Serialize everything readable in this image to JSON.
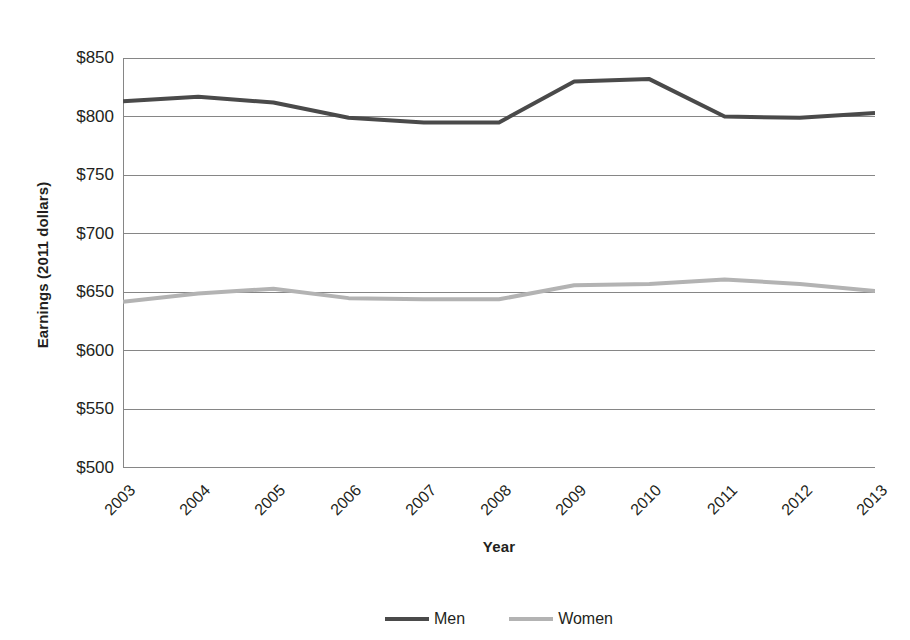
{
  "chart_data": {
    "type": "line",
    "title": "",
    "xlabel": "Year",
    "ylabel": "Earnings (2011 dollars)",
    "categories": [
      "2003",
      "2004",
      "2005",
      "2006",
      "2007",
      "2008",
      "2009",
      "2010",
      "2011",
      "2012",
      "2013"
    ],
    "x": [
      2003,
      2004,
      2005,
      2006,
      2007,
      2008,
      2009,
      2010,
      2011,
      2012,
      2013
    ],
    "ylim": [
      500,
      850
    ],
    "yticks": [
      850,
      800,
      750,
      700,
      650,
      600,
      550,
      500
    ],
    "ytick_labels": [
      "$850",
      "$800",
      "$750",
      "$700",
      "$650",
      "$600",
      "$550",
      "$500"
    ],
    "grid": "horizontal",
    "legend_position": "bottom",
    "series": [
      {
        "name": "Men",
        "color": "#4a4a4a",
        "values": [
          813,
          817,
          812,
          799,
          795,
          795,
          830,
          832,
          800,
          799,
          803
        ]
      },
      {
        "name": "Women",
        "color": "#b3b3b3",
        "values": [
          642,
          649,
          653,
          645,
          644,
          644,
          656,
          657,
          661,
          657,
          651
        ]
      }
    ]
  },
  "axes": {
    "y_title": "Earnings (2011 dollars)",
    "x_title": "Year"
  },
  "legend": {
    "items": [
      {
        "label": "Men",
        "color": "#4a4a4a"
      },
      {
        "label": "Women",
        "color": "#b3b3b3"
      }
    ]
  },
  "colors": {
    "men_line": "#4a4a4a",
    "women_line": "#b3b3b3",
    "gridline": "#868686",
    "axis": "#868686",
    "text": "#231f20",
    "background": "#ffffff"
  }
}
